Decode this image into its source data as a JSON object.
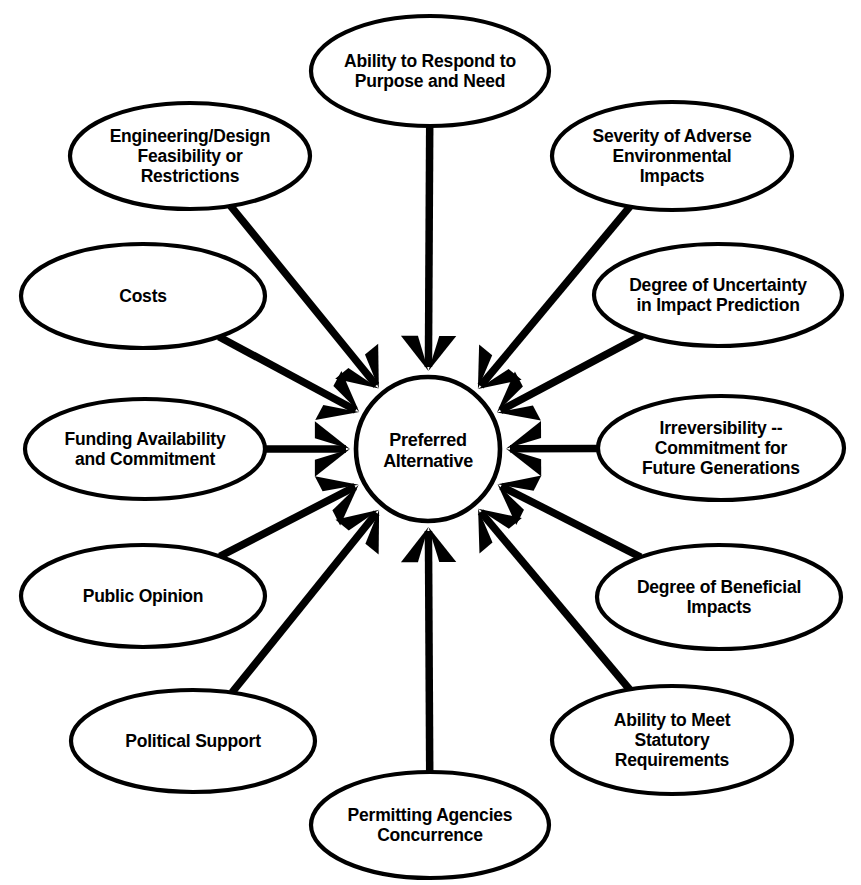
{
  "diagram": {
    "type": "hub-and-spoke",
    "background_color": "#ffffff",
    "stroke_color": "#000000",
    "hub": {
      "label_line_1": "Preferred",
      "label_line_2": "Alternative",
      "shape": "circle",
      "cx": 428,
      "cy": 449,
      "r": 72
    },
    "nodes": [
      {
        "id": "ability-to-respond",
        "lines": [
          "Ability to Respond to",
          "Purpose and Need"
        ],
        "cx": 430,
        "cy": 71,
        "rx": 119,
        "ry": 55,
        "arrow_from_angle": 90
      },
      {
        "id": "engineering-design",
        "lines": [
          "Engineering/Design",
          "Feasibility or",
          "Restrictions"
        ],
        "cx": 190,
        "cy": 156,
        "rx": 120,
        "ry": 53,
        "arrow_from_angle": 130
      },
      {
        "id": "severity-adverse",
        "lines": [
          "Severity of Adverse",
          "Environmental",
          "Impacts"
        ],
        "cx": 672,
        "cy": 156,
        "rx": 120,
        "ry": 54,
        "arrow_from_angle": 50
      },
      {
        "id": "costs",
        "lines": [
          "Costs"
        ],
        "cx": 143,
        "cy": 296,
        "rx": 122,
        "ry": 52,
        "arrow_from_angle": 155
      },
      {
        "id": "degree-uncertainty",
        "lines": [
          "Degree of Uncertainty",
          "in Impact Prediction"
        ],
        "cx": 718,
        "cy": 295,
        "rx": 124,
        "ry": 51,
        "arrow_from_angle": 25
      },
      {
        "id": "funding-availability",
        "lines": [
          "Funding Availability",
          "and Commitment"
        ],
        "cx": 145,
        "cy": 449,
        "rx": 120,
        "ry": 50,
        "arrow_from_angle": 180
      },
      {
        "id": "irreversibility",
        "lines": [
          "Irreversibility --",
          "Commitment for",
          "Future Generations"
        ],
        "cx": 721,
        "cy": 448,
        "rx": 123,
        "ry": 52,
        "arrow_from_angle": 0
      },
      {
        "id": "public-opinion",
        "lines": [
          "Public Opinion"
        ],
        "cx": 143,
        "cy": 596,
        "rx": 122,
        "ry": 51,
        "arrow_from_angle": 205
      },
      {
        "id": "degree-beneficial",
        "lines": [
          "Degree of Beneficial",
          "Impacts"
        ],
        "cx": 719,
        "cy": 597,
        "rx": 122,
        "ry": 52,
        "arrow_from_angle": 335
      },
      {
        "id": "political-support",
        "lines": [
          "Political Support"
        ],
        "cx": 193,
        "cy": 741,
        "rx": 122,
        "ry": 51,
        "arrow_from_angle": 228
      },
      {
        "id": "ability-statutory",
        "lines": [
          "Ability to Meet",
          "Statutory",
          "Requirements"
        ],
        "cx": 672,
        "cy": 740,
        "rx": 120,
        "ry": 54,
        "arrow_from_angle": 312
      },
      {
        "id": "permitting-agencies",
        "lines": [
          "Permitting Agencies",
          "Concurrence"
        ],
        "cx": 430,
        "cy": 825,
        "rx": 119,
        "ry": 53,
        "arrow_from_angle": 270
      }
    ]
  }
}
